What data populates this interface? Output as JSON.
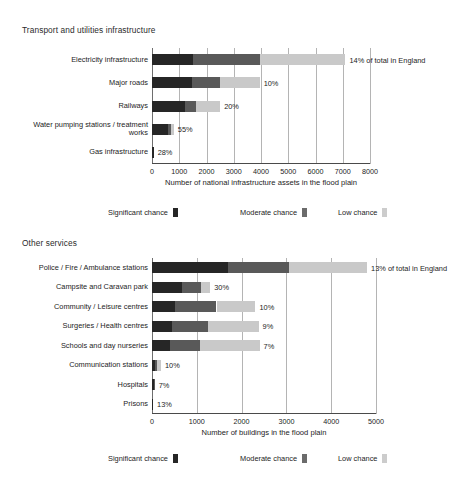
{
  "chart_data": [
    {
      "type": "bar",
      "orientation": "horizontal",
      "stacked": true,
      "title": "Transport and utilities infrastructure",
      "xlabel": "Number of national infrastructure assets in the flood plain",
      "ylabel": "",
      "xlim": [
        0,
        8000
      ],
      "xticks": [
        0,
        1000,
        2000,
        3000,
        4000,
        5000,
        6000,
        7000,
        8000
      ],
      "xtick_labels": [
        "0",
        "1000",
        "2000",
        "3000",
        "4000",
        "5000",
        "6000",
        "7000",
        "8000"
      ],
      "grid": true,
      "legend_position": "bottom",
      "categories": [
        "Electricity infrastructure",
        "Major roads",
        "Railways",
        "Water pumping stations / treatment works",
        "Gas infrastructure"
      ],
      "series": [
        {
          "name": "Significant chance",
          "color": "#262626",
          "values": [
            1500,
            1450,
            1200,
            600,
            60
          ]
        },
        {
          "name": "Moderate chance",
          "color": "#595959",
          "values": [
            2450,
            1050,
            430,
            100,
            0
          ]
        },
        {
          "name": "Low chance",
          "color": "#c9c9c9",
          "values": [
            3150,
            1450,
            870,
            100,
            0
          ]
        }
      ],
      "annotations": [
        "14% of total in England",
        "10%",
        "20%",
        "55%",
        "28%"
      ]
    },
    {
      "type": "bar",
      "orientation": "horizontal",
      "stacked": true,
      "title": "Other services",
      "xlabel": "Number of buildings in the flood plain",
      "ylabel": "",
      "xlim": [
        0,
        5000
      ],
      "xticks": [
        0,
        1000,
        2000,
        3000,
        4000,
        5000
      ],
      "xtick_labels": [
        "0",
        "1000",
        "2000",
        "3000",
        "4000",
        "5000"
      ],
      "grid": true,
      "legend_position": "bottom",
      "categories": [
        "Police / Fire / Ambulance stations",
        "Campsite and Caravan park",
        "Community / Leisure centres",
        "Surgeries / Health centres",
        "Schools and day nurseries",
        "Communication stations",
        "Hospitals",
        "Prisons"
      ],
      "series": [
        {
          "name": "Significant chance",
          "color": "#262626",
          "values": [
            1700,
            680,
            520,
            450,
            400,
            60,
            50,
            25
          ]
        },
        {
          "name": "Moderate chance",
          "color": "#595959",
          "values": [
            1350,
            420,
            920,
            800,
            680,
            60,
            10,
            0
          ]
        },
        {
          "name": "Low chance",
          "color": "#c9c9c9",
          "values": [
            1750,
            200,
            870,
            1130,
            1320,
            80,
            0,
            0
          ]
        }
      ],
      "annotations": [
        "13% of total in England",
        "30%",
        "10%",
        "9%",
        "7%",
        "10%",
        "7%",
        "13%"
      ]
    }
  ],
  "top": {
    "title": "Transport and utilities infrastructure",
    "axis_title": "Number of national infrastructure assets in the flood plain",
    "ticks": [
      "0",
      "1000",
      "2000",
      "3000",
      "4000",
      "5000",
      "6000",
      "7000",
      "8000"
    ],
    "categories": [
      {
        "label": "Electricity infrastructure",
        "annotation": "14% of total in England"
      },
      {
        "label": "Major roads",
        "annotation": "10%"
      },
      {
        "label": "Railways",
        "annotation": "20%"
      },
      {
        "label": "Water pumping stations / treatment works",
        "annotation": "55%"
      },
      {
        "label": "Gas infrastructure",
        "annotation": "28%"
      }
    ],
    "legend": [
      {
        "label": "Significant chance",
        "color": "#262626"
      },
      {
        "label": "Moderate chance",
        "color": "#6b6b6b"
      },
      {
        "label": "Low chance",
        "color": "#cccccc"
      }
    ]
  },
  "bottom": {
    "title": "Other services",
    "axis_title": "Number of buildings in the flood plain",
    "ticks": [
      "0",
      "1000",
      "2000",
      "3000",
      "4000",
      "5000"
    ],
    "categories": [
      {
        "label": "Police / Fire / Ambulance stations",
        "annotation": "13% of total in England"
      },
      {
        "label": "Campsite and Caravan park",
        "annotation": "30%"
      },
      {
        "label": "Community / Leisure centres",
        "annotation": "10%"
      },
      {
        "label": "Surgeries / Health centres",
        "annotation": "9%"
      },
      {
        "label": "Schools and day nurseries",
        "annotation": "7%"
      },
      {
        "label": "Communication stations",
        "annotation": "10%"
      },
      {
        "label": "Hospitals",
        "annotation": "7%"
      },
      {
        "label": "Prisons",
        "annotation": "13%"
      }
    ],
    "legend": [
      {
        "label": "Significant chance",
        "color": "#262626"
      },
      {
        "label": "Moderate chance",
        "color": "#6b6b6b"
      },
      {
        "label": "Low chance",
        "color": "#cccccc"
      }
    ]
  }
}
